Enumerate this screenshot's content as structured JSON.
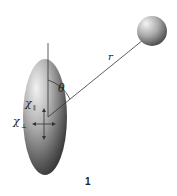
{
  "figure": {
    "number_label": "1",
    "distance_label": "r",
    "angle_label": "θ",
    "chi_parallel": {
      "symbol": "χ",
      "subscript": "∥"
    },
    "chi_perpendicular": {
      "symbol": "χ",
      "subscript": "⊥"
    }
  },
  "elements": {
    "ellipsoid": {
      "description": "anisotropic susceptibility ellipsoid",
      "color_light": "#e8e8e8",
      "color_dark": "#2a2a2a"
    },
    "sphere": {
      "description": "point object / nucleus",
      "color_light": "#f0f0f0",
      "color_dark": "#444444"
    },
    "line_color": "#333333"
  }
}
